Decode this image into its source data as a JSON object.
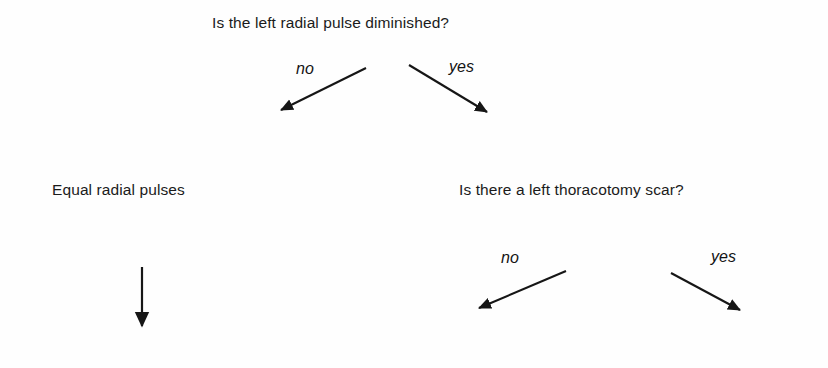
{
  "diagram": {
    "type": "decision-tree",
    "title": "Is the left radial pulse diminished?",
    "background_color": "#fefefe",
    "line_color": "#161616",
    "text_color": "#1b1b1b",
    "nodes": [
      {
        "id": "root",
        "label": "Is the left radial pulse diminished?",
        "kind": "question"
      },
      {
        "id": "equal-pulses",
        "label": "Equal radial pulses",
        "kind": "outcome"
      },
      {
        "id": "thoracotomy",
        "label": "Is there a left thoracotomy scar?",
        "kind": "question"
      }
    ],
    "edges": [
      {
        "id": "root-no",
        "from": "root",
        "to": "equal-pulses",
        "label": "no"
      },
      {
        "id": "root-yes",
        "from": "root",
        "to": "thoracotomy",
        "label": "yes"
      },
      {
        "id": "equal-down",
        "from": "equal-pulses",
        "to": "",
        "label": ""
      },
      {
        "id": "thor-no",
        "from": "thoracotomy",
        "to": "",
        "label": "no"
      },
      {
        "id": "thor-yes",
        "from": "thoracotomy",
        "to": "",
        "label": "yes"
      }
    ]
  }
}
